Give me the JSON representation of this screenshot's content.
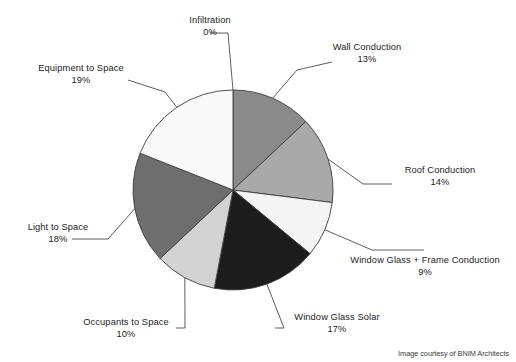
{
  "chart_data": {
    "type": "pie",
    "title": "",
    "subtitle": "",
    "xlabel": "",
    "ylabel": "",
    "legend_position": "none",
    "grid": false,
    "units": "percent",
    "start_angle_deg": 0,
    "direction": "clockwise",
    "categories": [
      "Infiltration",
      "Wall Conduction",
      "Roof Conduction",
      "Window Glass + Frame Conduction",
      "Window Glass Solar",
      "Occupants to Space",
      "Light to Space",
      "Equipment to Space"
    ],
    "values": [
      0,
      13,
      14,
      9,
      17,
      10,
      18,
      19
    ],
    "slices": [
      {
        "label": "Infiltration",
        "value": 0,
        "percent_text": "0%",
        "color": "#f9f9f9",
        "start_deg": 0.0,
        "end_deg": 0.0
      },
      {
        "label": "Wall Conduction",
        "value": 13,
        "percent_text": "13%",
        "color": "#8a8a8a",
        "start_deg": 0.0,
        "end_deg": 46.8
      },
      {
        "label": "Roof Conduction",
        "value": 14,
        "percent_text": "14%",
        "color": "#a9a9a9",
        "start_deg": 46.8,
        "end_deg": 97.2
      },
      {
        "label": "Window Glass + Frame Conduction",
        "value": 9,
        "percent_text": "9%",
        "color": "#f4f4f4",
        "start_deg": 97.2,
        "end_deg": 129.6
      },
      {
        "label": "Window Glass Solar",
        "value": 17,
        "percent_text": "17%",
        "color": "#1d1d1d",
        "start_deg": 129.6,
        "end_deg": 190.8
      },
      {
        "label": "Occupants to Space",
        "value": 10,
        "percent_text": "10%",
        "color": "#d2d2d2",
        "start_deg": 190.8,
        "end_deg": 226.8
      },
      {
        "label": "Light to Space",
        "value": 18,
        "percent_text": "18%",
        "color": "#6e6e6e",
        "start_deg": 226.8,
        "end_deg": 291.6
      },
      {
        "label": "Equipment to Space",
        "value": 19,
        "percent_text": "19%",
        "color": "#f9f9f9",
        "start_deg": 291.6,
        "end_deg": 360.0
      }
    ]
  },
  "labels": {
    "infiltration": {
      "name": "Infiltration",
      "percent": "0%"
    },
    "wall_conduction": {
      "name": "Wall Conduction",
      "percent": "13%"
    },
    "roof_conduction": {
      "name": "Roof Conduction",
      "percent": "14%"
    },
    "window_glass_frame": {
      "name": "Window Glass + Frame Conduction",
      "percent": "9%"
    },
    "window_glass_solar": {
      "name": "Window Glass Solar",
      "percent": "17%"
    },
    "occupants_to_space": {
      "name": "Occupants to Space",
      "percent": "10%"
    },
    "light_to_space": {
      "name": "Light to Space",
      "percent": "18%"
    },
    "equipment_to_space": {
      "name": "Equipment to Space",
      "percent": "19%"
    }
  },
  "credit": {
    "text": "Image courtesy of BNIM Architects"
  },
  "style": {
    "stroke_color": "#3d3d3d",
    "leader_color": "#4a4a4a",
    "text_color": "#1b1b1b",
    "background": "#ffffff"
  }
}
